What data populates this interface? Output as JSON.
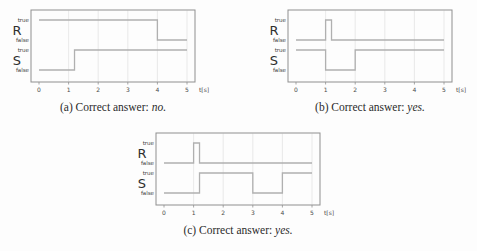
{
  "page": {
    "background": "#fdfdfd"
  },
  "styles": {
    "signal_color": "#b0b0b0",
    "box_color": "#8f8f8f",
    "grid_color": "#e3e3e3",
    "tick_text_color": "#4a4a4a",
    "label_text_color": "#3c3c3c",
    "signal_name_color": "#2f2f2f",
    "caption_color": "#2b2b2b"
  },
  "chart_data": [
    {
      "id": "a",
      "type": "line",
      "xlabel": "t[s]",
      "xlim": [
        0,
        5
      ],
      "x_ticks": [
        0,
        1,
        2,
        3,
        4,
        5
      ],
      "grid": "vertical",
      "level_labels": {
        "true": "true",
        "false": "false"
      },
      "signals": [
        {
          "name": "R",
          "segments": [
            {
              "from": 0,
              "to": 4,
              "value": "true"
            },
            {
              "from": 4,
              "to": 5,
              "value": "false"
            }
          ]
        },
        {
          "name": "S",
          "segments": [
            {
              "from": 0,
              "to": 1.2,
              "value": "false"
            },
            {
              "from": 1.2,
              "to": 5,
              "value": "true"
            }
          ]
        }
      ],
      "caption": {
        "prefix": "(a) Correct answer:",
        "answer": "no."
      }
    },
    {
      "id": "b",
      "type": "line",
      "xlabel": "t[s]",
      "xlim": [
        0,
        5
      ],
      "x_ticks": [
        0,
        1,
        2,
        3,
        4,
        5
      ],
      "grid": "vertical",
      "level_labels": {
        "true": "true",
        "false": "false"
      },
      "signals": [
        {
          "name": "R",
          "segments": [
            {
              "from": 0,
              "to": 1,
              "value": "false"
            },
            {
              "from": 1,
              "to": 1.2,
              "value": "true"
            },
            {
              "from": 1.2,
              "to": 5,
              "value": "false"
            }
          ]
        },
        {
          "name": "S",
          "segments": [
            {
              "from": 0,
              "to": 1,
              "value": "true"
            },
            {
              "from": 1,
              "to": 2,
              "value": "false"
            },
            {
              "from": 2,
              "to": 5,
              "value": "true"
            }
          ]
        }
      ],
      "caption": {
        "prefix": "(b) Correct answer:",
        "answer": "yes."
      }
    },
    {
      "id": "c",
      "type": "line",
      "xlabel": "t[s]",
      "xlim": [
        0,
        5
      ],
      "x_ticks": [
        0,
        1,
        2,
        3,
        4,
        5
      ],
      "grid": "vertical",
      "level_labels": {
        "true": "true",
        "false": "false"
      },
      "signals": [
        {
          "name": "R",
          "segments": [
            {
              "from": 0,
              "to": 1,
              "value": "false"
            },
            {
              "from": 1,
              "to": 1.2,
              "value": "true"
            },
            {
              "from": 1.2,
              "to": 5,
              "value": "false"
            }
          ]
        },
        {
          "name": "S",
          "segments": [
            {
              "from": 0,
              "to": 1.2,
              "value": "false"
            },
            {
              "from": 1.2,
              "to": 3,
              "value": "true"
            },
            {
              "from": 3,
              "to": 4,
              "value": "false"
            },
            {
              "from": 4,
              "to": 5,
              "value": "true"
            }
          ]
        }
      ],
      "caption": {
        "prefix": "(c) Correct answer:",
        "answer": "yes."
      }
    }
  ]
}
